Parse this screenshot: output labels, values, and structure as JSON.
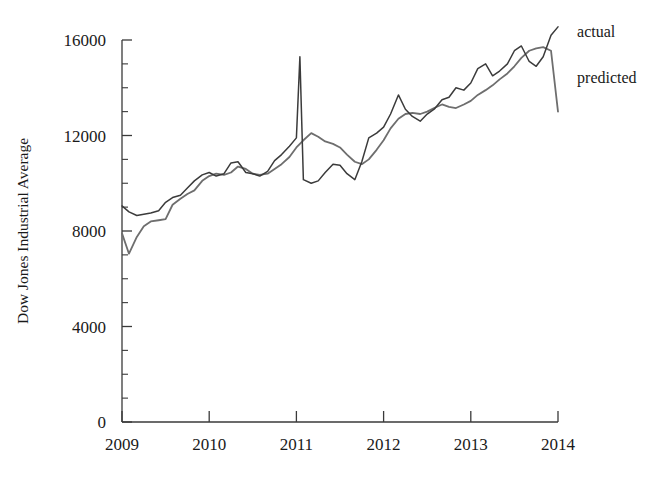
{
  "chart_data": {
    "type": "line",
    "title": "",
    "xlabel": "",
    "ylabel": "Dow Jones Industrial Average",
    "xlim": [
      2009,
      2014
    ],
    "ylim": [
      0,
      16000
    ],
    "y_ticks_major": [
      0,
      4000,
      8000,
      12000,
      16000
    ],
    "y_ticks_major_labels": [
      "0",
      "4000",
      "8000",
      "12000",
      "16000"
    ],
    "y_tick_minor_step": 1000,
    "x_ticks": [
      2009,
      2010,
      2011,
      2012,
      2013,
      2014
    ],
    "x_tick_labels": [
      "2009",
      "2010",
      "2011",
      "2012",
      "2013",
      "2014"
    ],
    "grid": false,
    "legend_position": "right-outside",
    "legend_entries": [
      "actual",
      "predicted"
    ],
    "colors": {
      "actual": "#3b3b3b",
      "predicted": "#6e6e6e"
    },
    "series": [
      {
        "name": "actual",
        "color": "#3b3b3b",
        "x": [
          2009.0,
          2009.08,
          2009.17,
          2009.25,
          2009.33,
          2009.42,
          2009.5,
          2009.58,
          2009.67,
          2009.75,
          2009.83,
          2009.92,
          2010.0,
          2010.08,
          2010.17,
          2010.25,
          2010.33,
          2010.42,
          2010.5,
          2010.58,
          2010.67,
          2010.75,
          2010.83,
          2010.92,
          2011.0,
          2011.04,
          2011.08,
          2011.17,
          2011.25,
          2011.33,
          2011.42,
          2011.5,
          2011.58,
          2011.67,
          2011.75,
          2011.83,
          2011.92,
          2012.0,
          2012.08,
          2012.17,
          2012.25,
          2012.33,
          2012.42,
          2012.5,
          2012.58,
          2012.67,
          2012.75,
          2012.83,
          2012.92,
          2013.0,
          2013.08,
          2013.17,
          2013.25,
          2013.33,
          2013.42,
          2013.5,
          2013.58,
          2013.67,
          2013.75,
          2013.83,
          2013.92,
          2014.0
        ],
        "y": [
          9050,
          8800,
          8650,
          8700,
          8750,
          8850,
          9200,
          9400,
          9500,
          9800,
          10100,
          10350,
          10450,
          10300,
          10400,
          10850,
          10900,
          10450,
          10400,
          10300,
          10500,
          10950,
          11200,
          11550,
          11900,
          15300,
          10150,
          10000,
          10100,
          10450,
          10800,
          10750,
          10400,
          10150,
          10900,
          11900,
          12100,
          12350,
          12900,
          13700,
          13100,
          12800,
          12600,
          12900,
          13100,
          13500,
          13600,
          14000,
          13900,
          14200,
          14800,
          15000,
          14500,
          14700,
          15000,
          15550,
          15750,
          15100,
          14900,
          15300,
          16200,
          16550
        ]
      },
      {
        "name": "predicted",
        "color": "#6e6e6e",
        "x": [
          2009.0,
          2009.08,
          2009.17,
          2009.25,
          2009.33,
          2009.42,
          2009.5,
          2009.58,
          2009.67,
          2009.75,
          2009.83,
          2009.92,
          2010.0,
          2010.08,
          2010.17,
          2010.25,
          2010.33,
          2010.42,
          2010.5,
          2010.58,
          2010.67,
          2010.75,
          2010.83,
          2010.92,
          2011.0,
          2011.08,
          2011.17,
          2011.25,
          2011.33,
          2011.42,
          2011.5,
          2011.58,
          2011.67,
          2011.75,
          2011.83,
          2011.92,
          2012.0,
          2012.08,
          2012.17,
          2012.25,
          2012.33,
          2012.42,
          2012.5,
          2012.58,
          2012.67,
          2012.75,
          2012.83,
          2012.92,
          2013.0,
          2013.08,
          2013.17,
          2013.25,
          2013.33,
          2013.42,
          2013.5,
          2013.58,
          2013.67,
          2013.75,
          2013.83,
          2013.92,
          2014.0
        ],
        "y": [
          7900,
          7050,
          7750,
          8200,
          8400,
          8450,
          8500,
          9100,
          9350,
          9550,
          9700,
          10100,
          10300,
          10400,
          10350,
          10450,
          10700,
          10600,
          10400,
          10350,
          10400,
          10600,
          10800,
          11100,
          11500,
          11800,
          12100,
          11950,
          11750,
          11650,
          11500,
          11200,
          10900,
          10800,
          11000,
          11400,
          11800,
          12300,
          12700,
          12900,
          12950,
          12900,
          13000,
          13150,
          13300,
          13200,
          13150,
          13300,
          13450,
          13700,
          13900,
          14100,
          14350,
          14600,
          14900,
          15250,
          15550,
          15650,
          15700,
          15550,
          13000
        ]
      }
    ],
    "annotations": [
      {
        "text": "actual",
        "x": 2014.15,
        "y": 16350
      },
      {
        "text": "predicted",
        "x": 2014.15,
        "y": 14400
      }
    ]
  }
}
